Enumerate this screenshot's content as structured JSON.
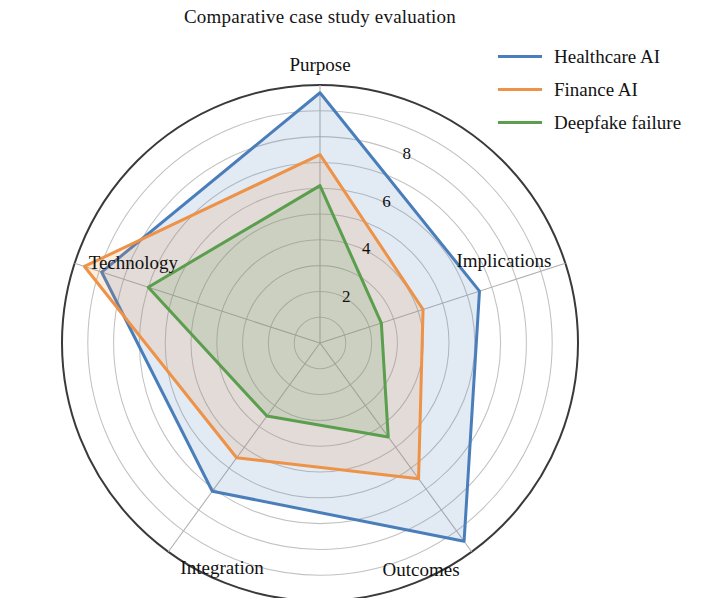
{
  "chart_data": {
    "type": "radar",
    "title": "Comparative case study evaluation",
    "categories": [
      "Purpose",
      "Technology",
      "Integration",
      "Outcomes",
      "Implications"
    ],
    "series": [
      {
        "name": "Healthcare AI",
        "color": "#4a7ebb",
        "values": [
          9.7,
          8.9,
          7.1,
          9.5,
          6.5
        ]
      },
      {
        "name": "Finance AI",
        "color": "#ed9247",
        "values": [
          7.3,
          9.6,
          5.5,
          6.5,
          4.2
        ]
      },
      {
        "name": "Deepfake failure",
        "color": "#5a9e4e",
        "values": [
          6.1,
          7.0,
          3.5,
          4.5,
          2.5
        ]
      }
    ],
    "ticks": [
      2,
      4,
      6,
      8
    ],
    "rlim": [
      0,
      10
    ],
    "grid": true,
    "legend_position": "upper right",
    "xlabel": "",
    "ylabel": ""
  },
  "legend": {
    "items": [
      {
        "label": "Healthcare AI"
      },
      {
        "label": "Finance AI"
      },
      {
        "label": "Deepfake failure"
      }
    ]
  },
  "axis_labels": {
    "purpose": "Purpose",
    "technology": "Technology",
    "integration": "Integration",
    "outcomes": "Outcomes",
    "implications": "Implications"
  },
  "tick_labels": {
    "t2": "2",
    "t4": "4",
    "t6": "6",
    "t8": "8"
  }
}
